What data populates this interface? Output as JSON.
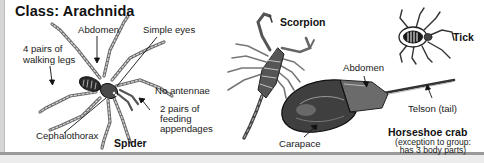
{
  "title": "Class: Arachnida",
  "spider": {
    "name": "Spider",
    "labels": {
      "abdomen": "Abdomen",
      "simple_eyes": "Simple eyes",
      "walking_legs_line1": "4 pairs of",
      "walking_legs_line2": "walking legs",
      "no_antennae": "No antennae",
      "feeding_line1": "2 pairs of",
      "feeding_line2": "feeding",
      "feeding_line3": "appendages",
      "cephalothorax": "Cephalothorax"
    }
  },
  "scorpion": {
    "name": "Scorpion"
  },
  "tick": {
    "name": "Tick"
  },
  "horseshoe_crab": {
    "name": "Horseshoe crab",
    "note_line1": "(exception to group:",
    "note_line2": "has 3 body parts)",
    "labels": {
      "abdomen": "Abdomen",
      "telson": "Telson (tail)",
      "carapace": "Carapace"
    }
  },
  "colors": {
    "ink": "#1a1a1a",
    "border": "#9a9a9a",
    "background": "#ffffff"
  }
}
